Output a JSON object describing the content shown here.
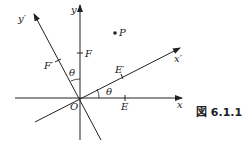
{
  "figure": {
    "caption": "図 6.1.1",
    "labels": {
      "x": "x",
      "y": "y",
      "x_prime": "x′",
      "y_prime": "y′",
      "origin": "O",
      "E": "E",
      "E_prime": "E′",
      "F": "F",
      "F_prime": "F′",
      "P": "P",
      "theta_1": "θ",
      "theta_2": "θ"
    },
    "colors": {
      "line": "#222222",
      "background": "#ffffff"
    }
  }
}
